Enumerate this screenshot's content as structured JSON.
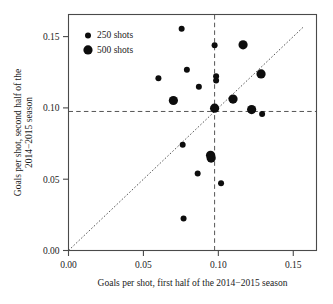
{
  "chart_data": {
    "type": "scatter",
    "title": "",
    "xlabel": "Goals per shot, first half of the 2014−2015 season",
    "ylabel_line1": "Goals per shot, second half of the",
    "ylabel_line2": "2014−2015 season",
    "xlim": [
      0.0,
      0.1655
    ],
    "ylim": [
      0.0,
      0.1655
    ],
    "xticks": [
      0.0,
      0.05,
      0.1,
      0.15
    ],
    "yticks": [
      0.0,
      0.05,
      0.1,
      0.15
    ],
    "xticklabels": [
      "0.00",
      "0.05",
      "0.10",
      "0.15"
    ],
    "yticklabels": [
      "0.00",
      "0.05",
      "0.10",
      "0.15"
    ],
    "grid": false,
    "legend_position": "top-left",
    "legend": [
      {
        "label": "250 shots",
        "size": "small",
        "radius_px": 3.0
      },
      {
        "label": "500 shots",
        "size": "large",
        "radius_px": 4.6
      }
    ],
    "reference_lines": [
      {
        "name": "identity-line",
        "kind": "diagonal",
        "style": "dotted",
        "from": [
          0.0,
          0.0
        ],
        "to": [
          0.1565,
          0.1565
        ]
      },
      {
        "name": "mean-vertical-line",
        "kind": "vertical",
        "style": "dashed",
        "x": 0.0975
      },
      {
        "name": "mean-horizontal-line",
        "kind": "horizontal",
        "style": "dashed",
        "y": 0.0975
      }
    ],
    "series": [
      {
        "name": "250 shots",
        "size": "small",
        "points": [
          {
            "x": 0.06,
            "y": 0.1208
          },
          {
            "x": 0.0755,
            "y": 0.1555
          },
          {
            "x": 0.079,
            "y": 0.1268
          },
          {
            "x": 0.087,
            "y": 0.1148
          },
          {
            "x": 0.0975,
            "y": 0.144
          },
          {
            "x": 0.0985,
            "y": 0.1222
          },
          {
            "x": 0.0985,
            "y": 0.1192
          },
          {
            "x": 0.0762,
            "y": 0.0742
          },
          {
            "x": 0.0862,
            "y": 0.054
          },
          {
            "x": 0.0768,
            "y": 0.0224
          },
          {
            "x": 0.1018,
            "y": 0.0472
          },
          {
            "x": 0.1292,
            "y": 0.0958
          }
        ]
      },
      {
        "name": "500 shots",
        "size": "large",
        "points": [
          {
            "x": 0.07,
            "y": 0.1052
          },
          {
            "x": 0.1165,
            "y": 0.1442
          },
          {
            "x": 0.1285,
            "y": 0.1238
          },
          {
            "x": 0.1098,
            "y": 0.1062
          },
          {
            "x": 0.0975,
            "y": 0.0998
          },
          {
            "x": 0.1222,
            "y": 0.0988
          },
          {
            "x": 0.0948,
            "y": 0.0668
          },
          {
            "x": 0.0952,
            "y": 0.0648
          }
        ]
      }
    ]
  }
}
